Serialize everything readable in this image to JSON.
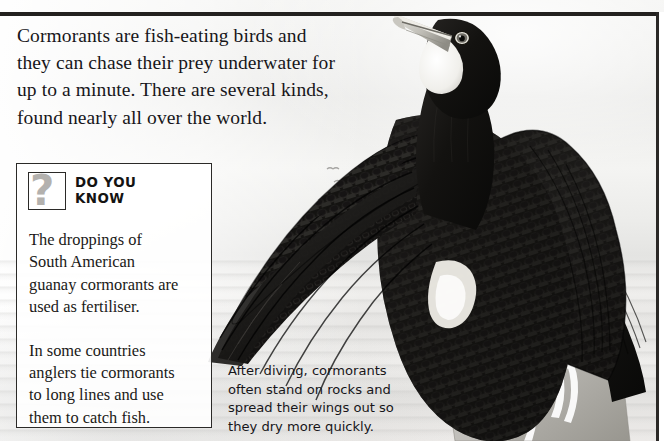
{
  "page": {
    "title": "Cormorants",
    "background_color": "#efeeec",
    "rule_color": "#23211f"
  },
  "intro": {
    "lines": [
      "Cormorants are fish-eating birds and",
      "they can chase their prey underwater for",
      "up to a minute. There are several kinds,",
      "found nearly all over the world."
    ]
  },
  "do_you_know": {
    "icon": "question-mark-icon",
    "title_line1": "DO YOU",
    "title_line2": "KNOW",
    "paragraphs": [
      [
        "The droppings of",
        "South American",
        "guanay cormorants are",
        "used as fertiliser."
      ],
      [
        "In some countries",
        "anglers tie cormorants",
        "to long lines and use",
        "them to catch fish."
      ]
    ],
    "border_color": "#2b2a28"
  },
  "photo": {
    "subject": "cormorant-drying-wings",
    "caption_lines": [
      "After diving, cormorants",
      "often stand on rocks and",
      "spread their wings out so",
      "they dry more quickly."
    ]
  }
}
